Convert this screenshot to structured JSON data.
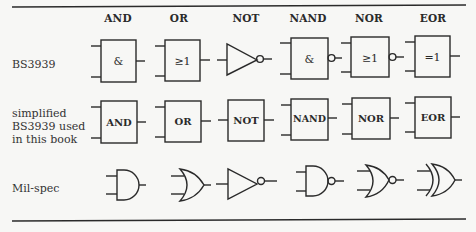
{
  "columns": [
    "AND",
    "OR",
    "NOT",
    "NAND",
    "NOR",
    "EOR"
  ],
  "rows": {
    "bs3939": {
      "label": "BS3939",
      "symbols": [
        "&",
        "≥1",
        "",
        "&",
        "≥1",
        "=1"
      ]
    },
    "simplified": {
      "label_line1": "simplified",
      "label_line2": "BS3939 used",
      "label_line3": "in this book",
      "symbols": [
        "AND",
        "OR",
        "NOT",
        "NAND",
        "NOR",
        "EOR"
      ]
    },
    "milspec": {
      "label": "Mil-spec"
    }
  },
  "colors": {
    "line": "#2a2a2a",
    "background": "#f7f7f5"
  }
}
